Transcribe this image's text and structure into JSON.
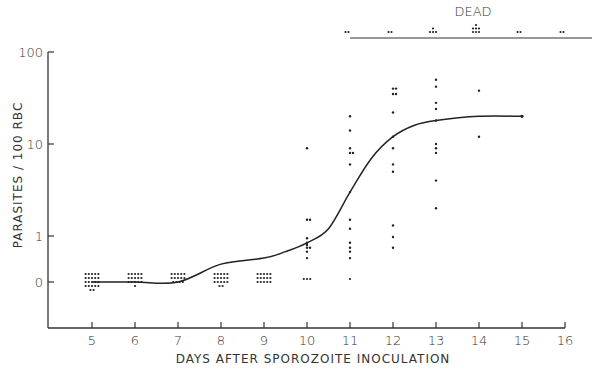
{
  "chart_data": {
    "type": "scatter",
    "title": "",
    "xlabel": "DAYS  AFTER  SPOROZOITE  INOCULATION",
    "ylabel": "PARASITES / 100 RBC",
    "x_ticks": [
      "5",
      "6",
      "7",
      "8",
      "9",
      "10",
      "11",
      "12",
      "13",
      "14",
      "15",
      "16"
    ],
    "y_ticks": [
      "0",
      "1",
      "10",
      "100"
    ],
    "y_scale": "log (with 0 baseline)",
    "xlim": [
      4,
      16
    ],
    "grid": false,
    "annotation": "DEAD",
    "dead_counts": [
      {
        "day": 11,
        "count": 2
      },
      {
        "day": 12,
        "count": 2
      },
      {
        "day": 13,
        "count": 4
      },
      {
        "day": 14,
        "count": 7
      },
      {
        "day": 15,
        "count": 2
      },
      {
        "day": 16,
        "count": 2
      }
    ],
    "series": [
      {
        "name": "individual animals",
        "points": [
          {
            "day": 5,
            "values": [
              0,
              0,
              0,
              0,
              0,
              0,
              0,
              0,
              0,
              0,
              0,
              0,
              0,
              0,
              0,
              0,
              0,
              0,
              0,
              0,
              0,
              0
            ]
          },
          {
            "day": 6,
            "values": [
              0,
              0,
              0,
              0,
              0,
              0,
              0,
              0,
              0,
              0,
              0,
              0,
              0,
              0,
              0,
              0
            ]
          },
          {
            "day": 7,
            "values": [
              0,
              0,
              0,
              0,
              0,
              0,
              0,
              0,
              0,
              0,
              0,
              0,
              0,
              0
            ]
          },
          {
            "day": 8,
            "values": [
              0,
              0,
              0,
              0,
              0,
              0,
              0,
              0,
              0,
              0,
              0,
              0,
              0,
              0,
              0,
              0,
              0
            ]
          },
          {
            "day": 9,
            "values": [
              0,
              0,
              0,
              0,
              0,
              0,
              0,
              0,
              0,
              0,
              0,
              0,
              0,
              0,
              0
            ]
          },
          {
            "day": 10,
            "values": [
              9,
              1.5,
              1.5,
              0.8,
              0.5,
              0.4,
              0.3,
              0.3,
              0.2,
              0.1,
              0,
              0,
              0
            ]
          },
          {
            "day": 11,
            "values": [
              20,
              14,
              9,
              8,
              8,
              6,
              3,
              1.5,
              1.2,
              0.5,
              0.3,
              0.2,
              0.1,
              0
            ]
          },
          {
            "day": 12,
            "values": [
              40,
              40,
              35,
              35,
              22,
              12,
              9,
              6,
              5,
              1.3,
              0.9,
              0.3
            ]
          },
          {
            "day": 13,
            "values": [
              50,
              42,
              28,
              24,
              18,
              10,
              9,
              8,
              4,
              2
            ]
          },
          {
            "day": 14,
            "values": [
              38,
              12
            ]
          }
        ]
      },
      {
        "name": "mean curve",
        "x": [
          5,
          6,
          7,
          8,
          9,
          9.5,
          10,
          10.5,
          11,
          11.5,
          12,
          12.5,
          13,
          14,
          15
        ],
        "values": [
          0,
          0,
          0,
          0.05,
          0.1,
          0.2,
          0.5,
          1.2,
          3,
          7,
          12,
          16,
          18,
          20,
          20
        ]
      }
    ]
  }
}
